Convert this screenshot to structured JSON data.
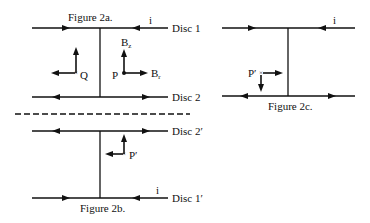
{
  "figures": {
    "fig2a": {
      "caption": "Figure 2a.",
      "disc_top_label": "Disc 1",
      "disc_bottom_label": "Disc 2",
      "current_label": "i",
      "point_q_label": "Q",
      "point_p_label": "P",
      "bz_label": "B",
      "bz_sub": "z",
      "br_label": "B",
      "br_sub": "r"
    },
    "mirror": {
      "label": "Mirror"
    },
    "fig2b": {
      "caption": "Figure 2b.",
      "disc_top_label": "Disc 2′",
      "disc_bottom_label": "Disc 1′",
      "current_label": "i",
      "point_label": "P′"
    },
    "fig2c": {
      "caption": "Figure 2c.",
      "current_label": "i",
      "point_label": "P′"
    }
  },
  "colors": {
    "ink": "#111111",
    "background": "#ffffff"
  }
}
